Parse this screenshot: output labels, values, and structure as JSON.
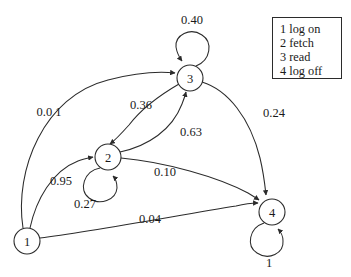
{
  "diagram": {
    "type": "state-transition-diagram",
    "title": "",
    "nodes": [
      {
        "id": "1",
        "label": "1",
        "name": "log on",
        "cx": 27,
        "cy": 241,
        "r": 13
      },
      {
        "id": "2",
        "label": "2",
        "name": "fetch",
        "cx": 108,
        "cy": 157,
        "r": 13
      },
      {
        "id": "3",
        "label": "3",
        "name": "read",
        "cx": 190,
        "cy": 78,
        "r": 13
      },
      {
        "id": "4",
        "label": "4",
        "name": "log off",
        "cx": 272,
        "cy": 212,
        "r": 13
      }
    ],
    "edges": [
      {
        "from": "1",
        "to": "3",
        "label": "0.0 1",
        "value": 0.01,
        "label_x": 49,
        "label_y": 112
      },
      {
        "from": "1",
        "to": "2",
        "label": "0.95",
        "value": 0.95,
        "label_x": 61,
        "label_y": 181
      },
      {
        "from": "1",
        "to": "4",
        "label": "0.04",
        "value": 0.04,
        "label_x": 150,
        "label_y": 219
      },
      {
        "from": "2",
        "to": "2",
        "label": "0.27",
        "value": 0.27,
        "label_x": 85,
        "label_y": 204,
        "self_loop": true
      },
      {
        "from": "2",
        "to": "3",
        "label": "0.63",
        "value": 0.63,
        "label_x": 191,
        "label_y": 132
      },
      {
        "from": "2",
        "to": "4",
        "label": "0.10",
        "value": 0.1,
        "label_x": 165,
        "label_y": 172
      },
      {
        "from": "3",
        "to": "2",
        "label": "0.36",
        "value": 0.36,
        "label_x": 141,
        "label_y": 105
      },
      {
        "from": "3",
        "to": "3",
        "label": "0.40",
        "value": 0.4,
        "label_x": 192,
        "label_y": 20,
        "self_loop": true
      },
      {
        "from": "3",
        "to": "4",
        "label": "0.24",
        "value": 0.24,
        "label_x": 274,
        "label_y": 113
      },
      {
        "from": "4",
        "to": "4",
        "label": "1",
        "value": 1.0,
        "label_x": 269,
        "label_y": 263,
        "self_loop": true
      }
    ]
  },
  "legend": {
    "rows": [
      {
        "key": "1",
        "text": "1 log on"
      },
      {
        "key": "2",
        "text": "2 fetch"
      },
      {
        "key": "3",
        "text": "3 read"
      },
      {
        "key": "4",
        "text": "4 log off"
      }
    ]
  },
  "colors": {
    "stroke": "#2b2b2b",
    "text": "#1a1a1a",
    "background": "#ffffff"
  }
}
